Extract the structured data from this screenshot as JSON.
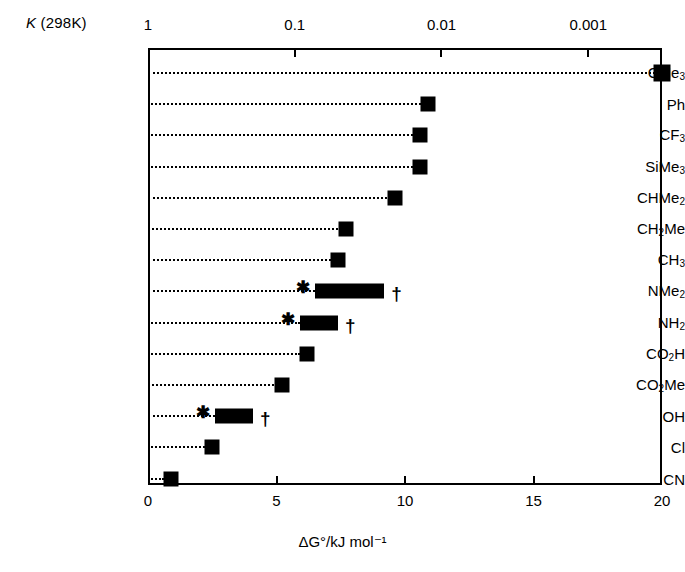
{
  "chart_data": {
    "type": "bar",
    "title": "",
    "xlabel": "ΔG°/kJ mol⁻¹",
    "ylabel": "",
    "xlim": [
      0,
      20
    ],
    "grid": false,
    "legend": "none",
    "orientation": "horizontal",
    "top_axis": {
      "label": "K (298K)",
      "label_italic_part": "K",
      "label_rest": " (298K)",
      "scale": "log-reciprocal",
      "tick_labels": [
        "1",
        "0.1",
        "0.01",
        "0.001"
      ],
      "tick_values_dG": [
        0.0,
        5.71,
        11.42,
        17.13
      ]
    },
    "bottom_axis": {
      "tick_labels": [
        "0",
        "5",
        "10",
        "15",
        "20"
      ],
      "tick_values": [
        0,
        5,
        10,
        15,
        20
      ]
    },
    "categories": [
      "CMe3",
      "Ph",
      "CF3",
      "SiMe3",
      "CHMe2",
      "CH2Me",
      "CH3",
      "NMe2",
      "NH2",
      "CO2H",
      "CO2Me",
      "OH",
      "Cl",
      "CN"
    ],
    "values": [
      20.0,
      10.9,
      10.6,
      10.6,
      9.6,
      7.7,
      7.4,
      7.9,
      6.7,
      6.2,
      5.2,
      3.4,
      2.5,
      0.9
    ],
    "rows": [
      {
        "label": "CMe",
        "sub": "3",
        "kind": "point",
        "value": 20.0,
        "marker_size": "large",
        "star": false,
        "dagger": false
      },
      {
        "label": "Ph",
        "sub": "",
        "kind": "point",
        "value": 10.9,
        "marker_size": "normal",
        "star": false,
        "dagger": false
      },
      {
        "label": "CF",
        "sub": "3",
        "kind": "point",
        "value": 10.6,
        "marker_size": "normal",
        "star": false,
        "dagger": false
      },
      {
        "label": "SiMe",
        "sub": "3",
        "kind": "point",
        "value": 10.6,
        "marker_size": "normal",
        "star": false,
        "dagger": false
      },
      {
        "label": "CHMe",
        "sub": "2",
        "kind": "point",
        "value": 9.6,
        "marker_size": "normal",
        "star": false,
        "dagger": false
      },
      {
        "label": "CH",
        "sub": "2",
        "label2": "Me",
        "kind": "point",
        "value": 7.7,
        "marker_size": "normal",
        "star": false,
        "dagger": false
      },
      {
        "label": "CH",
        "sub": "3",
        "kind": "point",
        "value": 7.4,
        "marker_size": "normal",
        "star": false,
        "dagger": false
      },
      {
        "label": "NMe",
        "sub": "2",
        "kind": "range",
        "low": 6.5,
        "high": 9.2,
        "star": true,
        "dagger": true
      },
      {
        "label": "NH",
        "sub": "2",
        "kind": "range",
        "low": 5.9,
        "high": 7.4,
        "star": true,
        "dagger": true
      },
      {
        "label": "CO",
        "sub": "2",
        "label2": "H",
        "kind": "point",
        "value": 6.2,
        "marker_size": "normal",
        "star": false,
        "dagger": false
      },
      {
        "label": "CO",
        "sub": "2",
        "label2": "Me",
        "kind": "point",
        "value": 5.2,
        "marker_size": "normal",
        "star": false,
        "dagger": false
      },
      {
        "label": "OH",
        "sub": "",
        "kind": "range",
        "low": 2.6,
        "high": 4.1,
        "star": true,
        "dagger": true
      },
      {
        "label": "Cl",
        "sub": "",
        "kind": "point",
        "value": 2.5,
        "marker_size": "normal",
        "star": false,
        "dagger": false
      },
      {
        "label": "CN",
        "sub": "",
        "kind": "point",
        "value": 0.9,
        "marker_size": "normal",
        "star": false,
        "dagger": false
      }
    ],
    "annotations": {
      "star_symbol": "✱",
      "dagger_symbol": "†"
    },
    "colors": {
      "marker": "#000000",
      "axis": "#000000",
      "background": "#ffffff"
    }
  }
}
